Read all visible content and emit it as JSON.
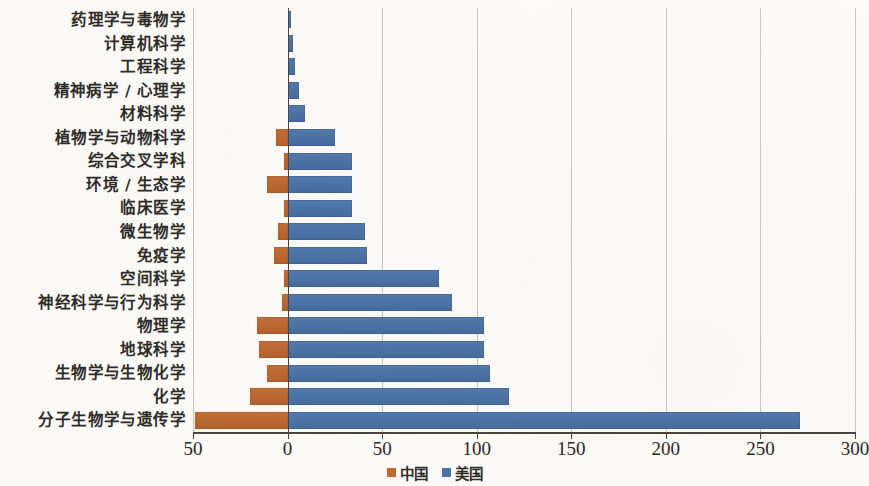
{
  "chart_data": {
    "type": "bar",
    "orientation": "horizontal-diverging",
    "title": "",
    "xlabel": "",
    "ylabel": "",
    "xlim": [
      -50,
      300
    ],
    "xticks": [
      -50,
      0,
      50,
      100,
      150,
      200,
      250,
      300
    ],
    "xtick_labels": [
      "50",
      "0",
      "50",
      "100",
      "150",
      "200",
      "250",
      "300"
    ],
    "grid": true,
    "legend_position": "bottom-center",
    "colors": {
      "china": "#c0682f",
      "usa": "#4a73a8",
      "axis": "#4a443c",
      "grid": "#c9c6bd"
    },
    "categories": [
      "药理学与毒物学",
      "计算机科学",
      "工程科学",
      "精神病学 / 心理学",
      "材料科学",
      "植物学与动物科学",
      "综合交叉学科",
      "环境 / 生态学",
      "临床医学",
      "微生物学",
      "免疫学",
      "空间科学",
      "神经科学与行为科学",
      "物理学",
      "地球科学",
      "生物学与生物化学",
      "化学",
      "分子生物学与遗传学"
    ],
    "series": [
      {
        "name": "中国",
        "color": "#c0682f",
        "values": [
          0,
          0,
          0,
          0,
          0,
          6,
          2,
          11,
          2,
          5,
          7,
          2,
          3,
          16,
          15,
          11,
          20,
          49
        ]
      },
      {
        "name": "美国",
        "color": "#4a73a8",
        "values": [
          2,
          3,
          4,
          6,
          9,
          25,
          34,
          34,
          34,
          41,
          42,
          80,
          87,
          104,
          104,
          107,
          117,
          271
        ]
      }
    ]
  },
  "legend": {
    "items": [
      {
        "label": "中国",
        "color": "#c0682f",
        "swatch": "legend-swatch-china"
      },
      {
        "label": "美国",
        "color": "#4a73a8",
        "swatch": "legend-swatch-usa"
      }
    ]
  }
}
